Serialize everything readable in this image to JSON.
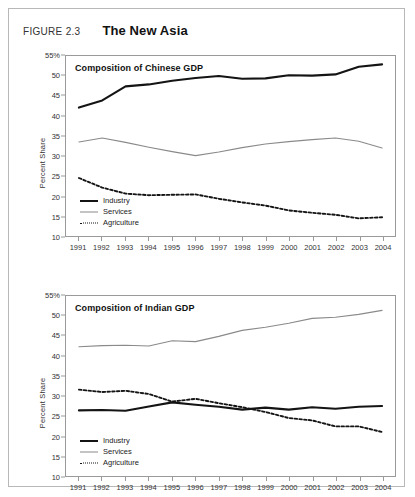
{
  "figure": {
    "number": "FIGURE 2.3",
    "title": "The New Asia"
  },
  "charts": [
    {
      "id": "china",
      "caption": "Composition of Chinese GDP",
      "ylabel": "Percent Share"
    },
    {
      "id": "india",
      "caption": "Composition of Indian GDP",
      "ylabel": "Percent Share"
    }
  ],
  "legend": {
    "industry": "Industry",
    "services": "Services",
    "agriculture": "Agriculture"
  },
  "colors": {
    "industry": "#141414",
    "services": "#8a8a8a",
    "agriculture": "#141414",
    "axis": "#9a9a9a",
    "frame": "#b8b8b8"
  },
  "chart_data": [
    {
      "type": "line",
      "title": "Composition of Chinese GDP",
      "xlabel": "",
      "ylabel": "Percent Share",
      "xlim": [
        1991,
        2004
      ],
      "ylim": [
        10,
        55
      ],
      "yticks": [
        10,
        15,
        20,
        25,
        30,
        35,
        40,
        45,
        50,
        55
      ],
      "ytick_labels": [
        "10",
        "15",
        "20",
        "25",
        "30",
        "35",
        "40",
        "45",
        "50",
        "55%"
      ],
      "grid": false,
      "legend_position": "bottom-left",
      "x": [
        1991,
        1992,
        1993,
        1994,
        1995,
        1996,
        1997,
        1998,
        1999,
        2000,
        2001,
        2002,
        2003,
        2004
      ],
      "categories": [
        "1991",
        "1992",
        "1993",
        "1994",
        "1995",
        "1996",
        "1997",
        "1998",
        "1999",
        "2000",
        "2001",
        "2002",
        "2003",
        "2004"
      ],
      "series": [
        {
          "name": "Industry",
          "style": "solid-black",
          "values": [
            42.1,
            43.9,
            47.4,
            47.9,
            48.8,
            49.5,
            50.0,
            49.3,
            49.4,
            50.2,
            50.1,
            50.4,
            52.3,
            52.9
          ]
        },
        {
          "name": "Services",
          "style": "solid-gray",
          "values": [
            33.5,
            34.5,
            33.4,
            32.2,
            31.1,
            30.1,
            31.0,
            32.1,
            33.0,
            33.6,
            34.1,
            34.5,
            33.7,
            32.0
          ]
        },
        {
          "name": "Agriculture",
          "style": "dotted-black",
          "values": [
            24.5,
            22.1,
            20.6,
            20.2,
            20.3,
            20.4,
            19.3,
            18.4,
            17.6,
            16.4,
            15.8,
            15.3,
            14.4,
            14.7
          ]
        }
      ]
    },
    {
      "type": "line",
      "title": "Composition of Indian GDP",
      "xlabel": "",
      "ylabel": "Percent Share",
      "xlim": [
        1991,
        2004
      ],
      "ylim": [
        10,
        55
      ],
      "yticks": [
        10,
        15,
        20,
        25,
        30,
        35,
        40,
        45,
        50,
        55
      ],
      "ytick_labels": [
        "10",
        "15",
        "20",
        "25",
        "30",
        "35",
        "40",
        "45",
        "50",
        "55%"
      ],
      "grid": false,
      "legend_position": "bottom-left",
      "x": [
        1991,
        1992,
        1993,
        1994,
        1995,
        1996,
        1997,
        1998,
        1999,
        2000,
        2001,
        2002,
        2003,
        2004
      ],
      "categories": [
        "1991",
        "1992",
        "1993",
        "1994",
        "1995",
        "1996",
        "1997",
        "1998",
        "1999",
        "2000",
        "2001",
        "2002",
        "2003",
        "2004"
      ],
      "series": [
        {
          "name": "Industry",
          "style": "solid-black",
          "values": [
            26.4,
            26.5,
            26.3,
            27.4,
            28.4,
            27.8,
            27.3,
            26.6,
            27.1,
            26.6,
            27.2,
            26.8,
            27.3,
            27.5
          ]
        },
        {
          "name": "Services",
          "style": "solid-gray",
          "values": [
            42.3,
            42.6,
            42.7,
            42.5,
            43.8,
            43.6,
            44.9,
            46.4,
            47.2,
            48.2,
            49.4,
            49.7,
            50.4,
            51.4
          ]
        },
        {
          "name": "Agriculture",
          "style": "dotted-black",
          "values": [
            31.6,
            31.0,
            31.3,
            30.5,
            28.6,
            29.3,
            28.2,
            27.2,
            26.0,
            24.5,
            23.9,
            22.4,
            22.4,
            21.0
          ]
        }
      ]
    }
  ]
}
